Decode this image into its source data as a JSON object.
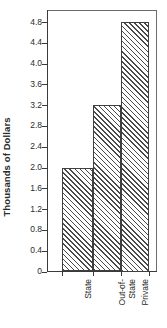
{
  "chart_data": {
    "type": "bar",
    "title": "",
    "subtitle": "",
    "xlabel": "",
    "ylabel": "Thousands of Dollars",
    "categories": [
      "State",
      "Out-of-State",
      "Private"
    ],
    "category_lines": [
      [
        "State"
      ],
      [
        "Out-of-",
        "State"
      ],
      [
        "Private"
      ]
    ],
    "values": [
      2.0,
      3.2,
      4.8
    ],
    "ylim": [
      0,
      4.8
    ],
    "ytick_values": [
      0,
      0.4,
      0.8,
      1.2,
      1.6,
      2.0,
      2.4,
      2.8,
      3.2,
      3.6,
      4.0,
      4.4,
      4.8
    ],
    "ytick_labels": [
      "0",
      "0.4",
      "0.8",
      "1.2",
      "1.6",
      "2.0",
      "2.4",
      "2.8",
      "3.2",
      "3.6",
      "4.0",
      "4.4",
      "4.8"
    ],
    "grid": false,
    "legend": false,
    "legend_position": "none",
    "bar_fill": "diagonal-hatch",
    "colors": {
      "hatch_line": "#4a4a4a",
      "bar_background": "#ffffff",
      "bar_border": "#3f3f3f",
      "axis": "#3a3a3a",
      "frame": "#6b6b6b",
      "text": "#2b2b2b",
      "plot_background": "#ffffff"
    }
  }
}
